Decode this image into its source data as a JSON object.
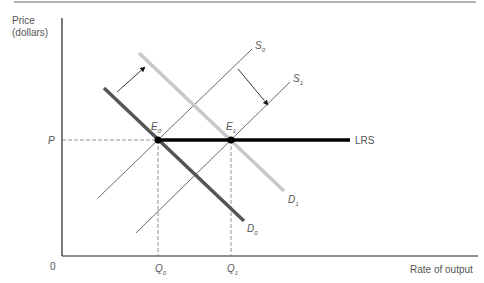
{
  "axes": {
    "y_label_line1": "Price",
    "y_label_line2": "(dollars)",
    "x_label": "Rate of output",
    "origin": "0",
    "price_tick": "P"
  },
  "curves": {
    "S0": {
      "letter": "S",
      "sub": "0"
    },
    "S1": {
      "letter": "S",
      "sub": "1"
    },
    "D0": {
      "letter": "D",
      "sub": "0"
    },
    "D1": {
      "letter": "D",
      "sub": "1"
    },
    "LRS": "LRS"
  },
  "points": {
    "E0": {
      "letter": "E",
      "sub": "0"
    },
    "E1": {
      "letter": "E",
      "sub": "1"
    }
  },
  "quantities": {
    "Q0": {
      "letter": "Q",
      "sub": "0"
    },
    "Q1": {
      "letter": "Q",
      "sub": "1"
    }
  },
  "colors": {
    "D0": "#555555",
    "D1": "#c8c8c8",
    "supply": "#444444",
    "LRS": "#000000",
    "axis": "#222222",
    "label": "#555555"
  }
}
